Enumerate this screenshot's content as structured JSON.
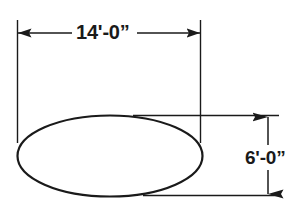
{
  "drawing": {
    "title": "Elliptical tank dimension drawing",
    "background_color": "#ffffff",
    "line_color": "#1a1a1a",
    "shape": {
      "name": "ellipse",
      "center_x": 110,
      "center_y": 156,
      "radius_x": 93,
      "radius_y": 41,
      "stroke_width": 2.2
    },
    "dimensions": {
      "width": {
        "label": "14'-0”",
        "orientation": "horizontal",
        "line_y": 33,
        "start_x": 18,
        "end_x": 200,
        "extension_left_x": 17,
        "extension_right_x": 200,
        "extension_top_y": 20,
        "extension_bottom_y": 143
      },
      "height": {
        "label": "6'-0”",
        "orientation": "vertical",
        "line_x": 268,
        "start_y": 117,
        "end_y": 194,
        "witness_top_y": 115,
        "witness_bottom_y": 195,
        "witness_left_x": 133,
        "witness_right_x": 279
      }
    }
  }
}
